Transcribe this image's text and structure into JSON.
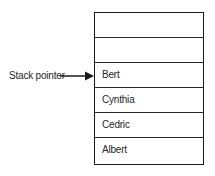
{
  "diagram": {
    "pointer": {
      "label": "Stack pointer",
      "points_to": "Bert"
    },
    "stack_cells": [
      {
        "value": ""
      },
      {
        "value": ""
      },
      {
        "value": "Bert"
      },
      {
        "value": "Cynthia"
      },
      {
        "value": "Cedric"
      },
      {
        "value": "Albert"
      }
    ],
    "colors": {
      "line": "#1b1b1b",
      "text": "#262626",
      "background": "#ffffff"
    }
  }
}
